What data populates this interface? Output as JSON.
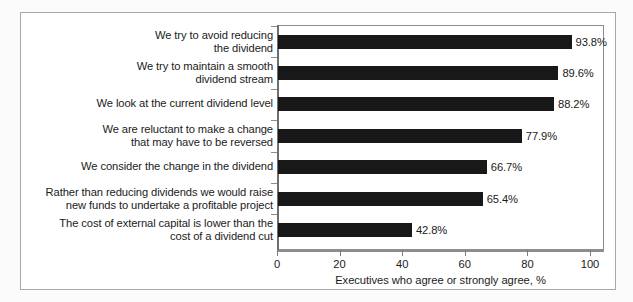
{
  "chart_data": {
    "type": "bar",
    "orientation": "horizontal",
    "title": "",
    "subtitle": "",
    "xlabel": "Executives who agree or strongly agree, %",
    "ylabel": "",
    "xlim": [
      0,
      100
    ],
    "xticks": [
      0,
      20,
      40,
      60,
      80,
      100
    ],
    "xtick_labels": [
      "0",
      "20",
      "40",
      "60",
      "80",
      "100"
    ],
    "grid": false,
    "legend": null,
    "bar_color": "#181818",
    "categories": [
      "We try to avoid reducing\nthe dividend",
      "We try to maintain a smooth\ndividend stream",
      "We look at the current dividend level",
      "We are reluctant to make a change\nthat may have to be reversed",
      "We consider the change in the dividend",
      "Rather than reducing dividends we would raise\nnew funds to undertake a profitable project",
      "The cost of external capital is lower than the\ncost of a dividend cut"
    ],
    "values": [
      93.8,
      89.6,
      88.2,
      77.9,
      66.7,
      65.4,
      42.8
    ],
    "value_labels": [
      "93.8%",
      "89.6%",
      "88.2%",
      "77.9%",
      "66.7%",
      "65.4%",
      "42.8%"
    ]
  },
  "colors": {
    "bar": "#181818",
    "axis": "#8d8d8d",
    "text": "#1b1b1b",
    "frame": "#a8a8a8",
    "page_background": "#fbfbfb"
  }
}
